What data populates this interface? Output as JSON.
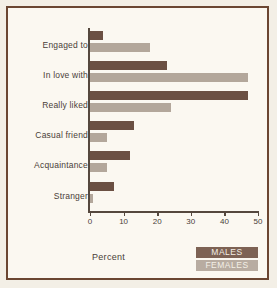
{
  "chart_data": {
    "type": "bar",
    "orientation": "horizontal",
    "title": "",
    "xlabel": "Percent",
    "ylabel": "",
    "xlim": [
      0,
      50
    ],
    "xticks": [
      0,
      10,
      20,
      30,
      40,
      50
    ],
    "grid": false,
    "legend_position": "bottom-right",
    "categories": [
      "Engaged to",
      "In love with",
      "Really liked",
      "Casual friend",
      "Acquaintance",
      "Stranger"
    ],
    "series": [
      {
        "name": "MALES",
        "color": "#6b5043",
        "values": [
          4,
          23,
          47,
          13,
          12,
          7
        ]
      },
      {
        "name": "FEMALES",
        "color": "#b3a79b",
        "values": [
          18,
          47,
          24,
          5,
          5,
          1
        ]
      }
    ]
  },
  "legend": {
    "items": [
      {
        "label": "MALES",
        "color": "#6b5043"
      },
      {
        "label": "FEMALES",
        "color": "#b3a79b"
      }
    ]
  },
  "colors": {
    "frame": "#6b4632",
    "background": "#fbf8f1",
    "axis": "#55483e",
    "text": "#4a4038"
  }
}
